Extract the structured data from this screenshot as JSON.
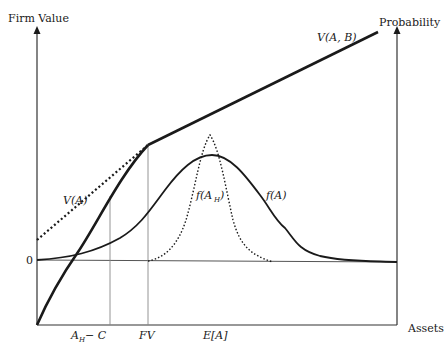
{
  "figure": {
    "axes": {
      "left_axis_label": "Firm Value",
      "right_axis_label": "Probability",
      "x_axis_label": "Assets",
      "zero_label": "0"
    },
    "x_ticks": [
      {
        "label_main": "A",
        "label_sub": "H",
        "label_tail": " − C",
        "full": "A_H − C"
      },
      {
        "label_main": "FV",
        "full": "FV"
      },
      {
        "label_main": "E[A]",
        "full": "E[A]"
      }
    ],
    "curves": {
      "vab": {
        "label": "V(A, B)",
        "style": "thick solid"
      },
      "va": {
        "label": "V(A)",
        "style": "dotted"
      },
      "fa": {
        "label": "f(A)",
        "style": "solid"
      },
      "fah": {
        "label_main": "f(A",
        "label_sub": "H",
        "label_tail": ")",
        "full": "f(A_H)",
        "style": "dotted"
      }
    },
    "colors": {
      "ink": "#1a1a1a",
      "guide": "#888888"
    }
  }
}
